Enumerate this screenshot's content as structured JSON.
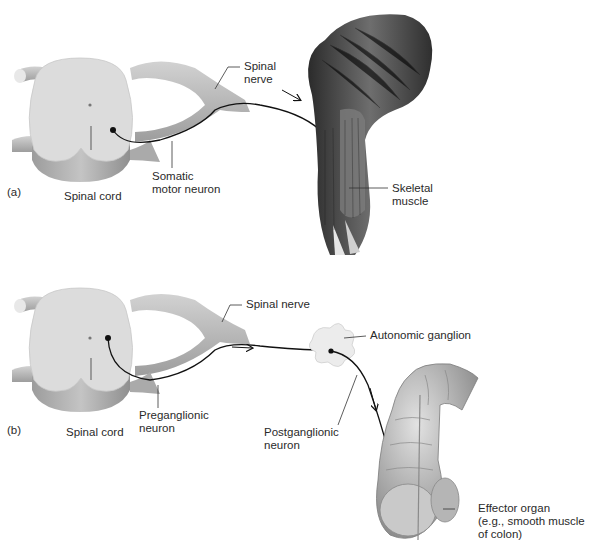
{
  "panel_a": {
    "letter": "(a)",
    "labels": {
      "spinal_nerve_1": "Spinal",
      "spinal_nerve_2": "nerve",
      "somatic_1": "Somatic",
      "somatic_2": "motor neuron",
      "spinal_cord": "Spinal cord",
      "skeletal_1": "Skeletal",
      "skeletal_2": "muscle"
    }
  },
  "panel_b": {
    "letter": "(b)",
    "labels": {
      "spinal_nerve": "Spinal nerve",
      "autonomic_ganglion": "Autonomic ganglion",
      "preganglionic_1": "Preganglionic",
      "preganglionic_2": "neuron",
      "spinal_cord": "Spinal cord",
      "postganglionic_1": "Postganglionic",
      "postganglionic_2": "neuron",
      "effector_1": "Effector organ",
      "effector_2": "(e.g., smooth muscle",
      "effector_3": "of colon)"
    }
  },
  "colors": {
    "background": "#ffffff",
    "spinal_cord_light": "#d9d9d9",
    "spinal_cord_dark": "#9a9a9a",
    "muscle": "#4a4a4a",
    "neuron": "#111111"
  }
}
